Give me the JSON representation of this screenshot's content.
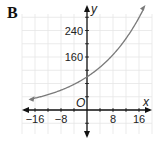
{
  "panel_label": "B",
  "chart_data": {
    "type": "line",
    "title": "",
    "xlabel": "x",
    "ylabel": "y",
    "origin_label": "O",
    "x_ticks": [
      -16,
      -8,
      8,
      16
    ],
    "y_ticks": [
      160,
      240
    ],
    "x_tick_labels": [
      "−16",
      "−8",
      "8",
      "16"
    ],
    "y_tick_labels": [
      "160",
      "240"
    ],
    "xlim": [
      -20,
      20
    ],
    "ylim": [
      -80,
      320
    ],
    "grid": true,
    "grid_step_x": 4,
    "grid_step_y": 40,
    "series": [
      {
        "name": "exponential curve",
        "description": "increasing exponential, y-intercept about 100, arrows at both ends",
        "x": [
          -18,
          -16,
          -12,
          -8,
          -4,
          0,
          4,
          8,
          12,
          16,
          18
        ],
        "values": [
          32,
          36,
          46,
          60,
          77,
          100,
          129,
          167,
          216,
          279,
          317
        ],
        "color": "#7a7a7a"
      }
    ]
  }
}
